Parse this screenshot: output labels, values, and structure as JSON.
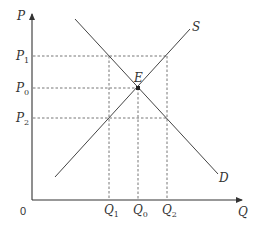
{
  "diagram": {
    "axes": {
      "y_label": "P",
      "x_label": "Q",
      "origin_label": "0"
    },
    "curves": {
      "supply_label": "S",
      "demand_label": "D"
    },
    "equilibrium_label": "E",
    "price_levels": [
      {
        "main": "P",
        "sub": "1"
      },
      {
        "main": "P",
        "sub": "0"
      },
      {
        "main": "P",
        "sub": "2"
      }
    ],
    "quantity_levels": [
      {
        "main": "Q",
        "sub": "1"
      },
      {
        "main": "Q",
        "sub": "0"
      },
      {
        "main": "Q",
        "sub": "2"
      }
    ],
    "colors": {
      "line": "#444444",
      "dashed": "#666666",
      "text": "#333333"
    }
  }
}
